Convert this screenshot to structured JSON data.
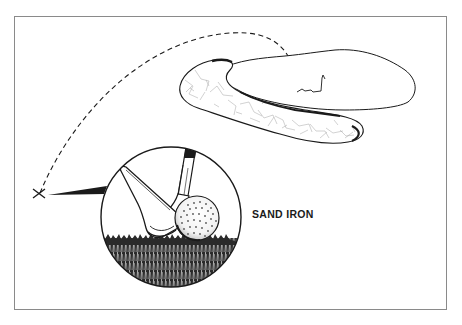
{
  "illustration": {
    "caption": "SAND IRON",
    "elements": {
      "trajectory": "dashed-ball-flight-arc",
      "origin_marker": "x-mark-icon",
      "green": "putting-green",
      "bunker": "sand-bunker",
      "flag": "flagstick-icon",
      "inset": "magnified-circle-club-and-ball"
    },
    "colors": {
      "ink": "#1a1a1a",
      "frame": "#8a8a8a",
      "background": "#ffffff",
      "sand_hatch": "#9a9a9a"
    }
  }
}
